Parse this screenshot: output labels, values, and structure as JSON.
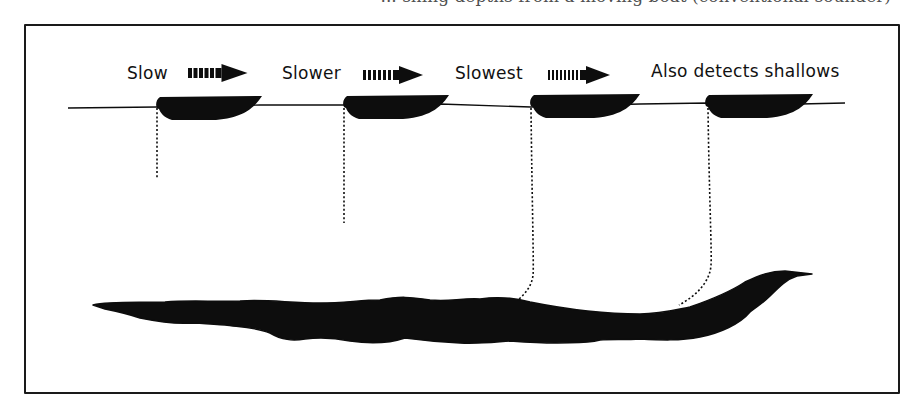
{
  "figure": {
    "caption_fragment": "... shing depths from a moving boat (conventional sounder)",
    "colors": {
      "ink": "#0d0d0d",
      "paper": "#ffffff",
      "frame": "#1a1a1a"
    },
    "frame": {
      "x": 24,
      "y": 24,
      "width": 876,
      "height": 370
    },
    "water_surface": {
      "points": "68,108 157,107 260,105 344,105 440,104 531,107 640,104 708,103 800,104 845,103"
    },
    "labels": [
      {
        "id": "slow",
        "text": "Slow",
        "x": 127,
        "y": 63
      },
      {
        "id": "slower",
        "text": "Slower",
        "x": 282,
        "y": 63
      },
      {
        "id": "slowest",
        "text": "Slowest",
        "x": 455,
        "y": 63
      },
      {
        "id": "shallows",
        "text": "Also detects shallows",
        "x": 651,
        "y": 61
      }
    ],
    "speed_arrows": [
      {
        "id": "arrow-slow",
        "x": 188,
        "y": 73,
        "bars": 5,
        "bar_width": 4,
        "bar_gap": 1.5,
        "head_len": 26
      },
      {
        "id": "arrow-slower",
        "x": 363,
        "y": 75,
        "bars": 6,
        "bar_width": 3,
        "bar_gap": 2,
        "head_len": 24
      },
      {
        "id": "arrow-slowest",
        "x": 548,
        "y": 75,
        "bars": 8,
        "bar_width": 2,
        "bar_gap": 2,
        "head_len": 24
      }
    ],
    "boats": [
      {
        "id": "boat-1",
        "x": 158,
        "y": 97,
        "width": 104
      },
      {
        "id": "boat-2",
        "x": 345,
        "y": 96,
        "width": 104
      },
      {
        "id": "boat-3",
        "x": 532,
        "y": 95,
        "width": 108
      },
      {
        "id": "boat-4",
        "x": 707,
        "y": 95,
        "width": 106
      }
    ],
    "sounding_lines": [
      {
        "id": "line-1",
        "path": "M157,108 L157,178",
        "reaches_bottom": false
      },
      {
        "id": "line-2",
        "path": "M344,108 L344,223",
        "reaches_bottom": false
      },
      {
        "id": "line-3",
        "path": "M531,108 C532,200 534,270 533,275 C532,285 526,293 519,299",
        "reaches_bottom": true
      },
      {
        "id": "line-4",
        "path": "M708,108 C709,190 712,255 711,265 C710,282 696,296 679,305",
        "reaches_bottom": true
      }
    ],
    "seabed": {
      "path": "M93,305 C110,301 140,303 165,302 C190,300 215,302 240,301 C265,299 290,303 320,303 C345,303 360,300 380,300 C400,296 410,297 430,300 C450,302 460,298 480,299 C500,296 515,298 530,302 C560,308 600,314 640,314 C660,314 675,310 690,307 C710,300 730,292 745,282 C760,275 770,271 785,271 L803,273 L812,274 L797,276 C787,279 780,286 770,296 C762,304 757,306 750,312 C740,324 720,333 700,337 C680,341 660,340 640,339 C625,340 610,339 600,340 C585,344 570,342 555,343 C540,343 525,342 510,341 C495,342 480,344 460,343 C440,342 420,340 405,338 C390,343 370,344 350,341 C335,338 320,337 305,339 C292,341 282,340 270,333 C255,327 240,327 225,325 C210,324 200,323 190,323 C175,324 160,322 140,318 C125,313 115,311 105,309 Z"
    }
  }
}
